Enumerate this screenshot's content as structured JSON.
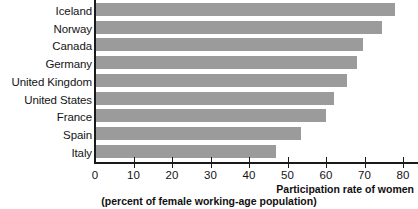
{
  "chart_data": {
    "type": "bar",
    "orientation": "horizontal",
    "title": "",
    "xlabel": "Participation rate of women",
    "xlabel_sub": "(percent of female working-age population)",
    "ylabel": "",
    "xlim": [
      0,
      80
    ],
    "xticks": [
      0,
      10,
      20,
      30,
      40,
      50,
      60,
      70,
      80
    ],
    "grid": false,
    "legend": null,
    "bar_color": "#9b9b9b",
    "axis_color": "#1a1a1a",
    "categories": [
      "Iceland",
      "Norway",
      "Canada",
      "Germany",
      "United Kingdom",
      "United States",
      "France",
      "Spain",
      "Italy"
    ],
    "values": [
      78,
      74.5,
      69.5,
      68,
      65.5,
      62,
      60,
      53.5,
      47
    ]
  },
  "axis": {
    "tick_labels": [
      "0",
      "10",
      "20",
      "30",
      "40",
      "50",
      "60",
      "70",
      "80"
    ],
    "caption_line_1": "Participation rate of women",
    "caption_line_2": "(percent of female working-age population)"
  }
}
